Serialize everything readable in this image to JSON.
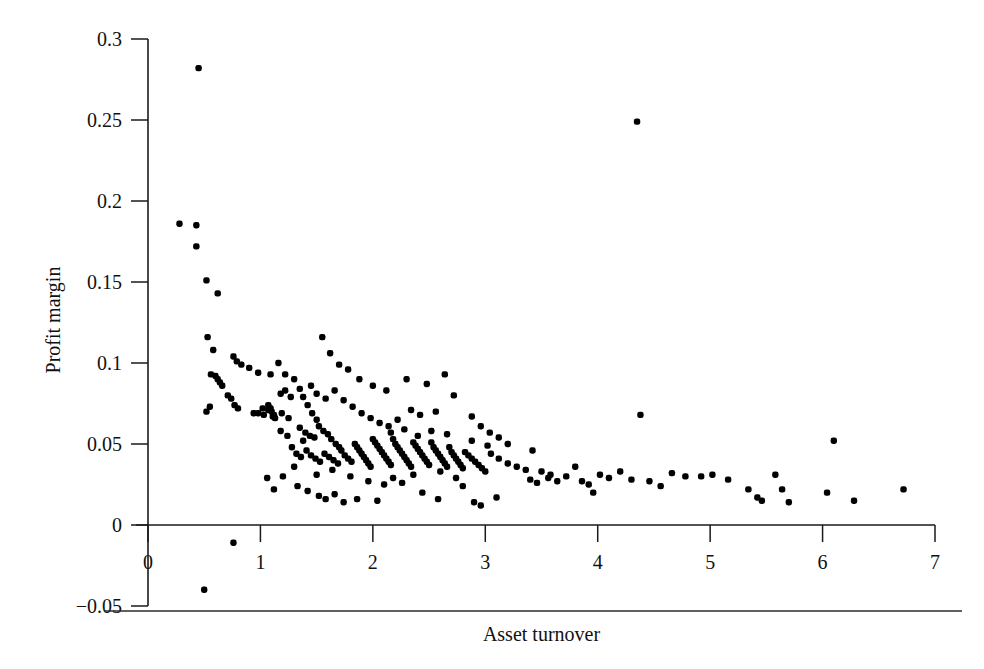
{
  "chart_data": {
    "type": "scatter",
    "title": "",
    "xlabel": "Asset turnover",
    "ylabel": "Profit margin",
    "xlim": [
      0,
      7
    ],
    "ylim": [
      -0.05,
      0.3
    ],
    "xticks": [
      0,
      1,
      2,
      3,
      4,
      5,
      6,
      7
    ],
    "xticklabels": [
      "0",
      "1",
      "2",
      "3",
      "4",
      "5",
      "6",
      "7"
    ],
    "yticks": [
      -0.05,
      0,
      0.05,
      0.1,
      0.15,
      0.2,
      0.25,
      0.3
    ],
    "yticklabels": [
      "−0.05",
      "0",
      "0.05",
      "0.1",
      "0.15",
      "0.2",
      "0.25",
      "0.3"
    ],
    "grid": false,
    "legend": false,
    "marker": "filled-square-dot",
    "marker_color": "#000000",
    "marker_size": 3.2,
    "n_points": 236,
    "series": [
      {
        "name": "Firms",
        "points": [
          [
            0.45,
            0.282
          ],
          [
            0.28,
            0.186
          ],
          [
            0.43,
            0.185
          ],
          [
            0.43,
            0.172
          ],
          [
            0.52,
            0.151
          ],
          [
            0.62,
            0.143
          ],
          [
            0.53,
            0.116
          ],
          [
            0.58,
            0.108
          ],
          [
            0.76,
            0.104
          ],
          [
            0.79,
            0.101
          ],
          [
            0.83,
            0.099
          ],
          [
            0.9,
            0.097
          ],
          [
            0.98,
            0.094
          ],
          [
            1.09,
            0.093
          ],
          [
            1.16,
            0.1
          ],
          [
            1.22,
            0.093
          ],
          [
            0.56,
            0.093
          ],
          [
            0.6,
            0.092
          ],
          [
            0.62,
            0.09
          ],
          [
            0.64,
            0.088
          ],
          [
            0.66,
            0.086
          ],
          [
            0.71,
            0.08
          ],
          [
            0.74,
            0.078
          ],
          [
            0.77,
            0.074
          ],
          [
            0.8,
            0.072
          ],
          [
            0.55,
            0.073
          ],
          [
            0.52,
            0.07
          ],
          [
            1.02,
            0.072
          ],
          [
            1.07,
            0.071
          ],
          [
            1.12,
            0.068
          ],
          [
            1.18,
            0.081
          ],
          [
            1.22,
            0.083
          ],
          [
            1.27,
            0.079
          ],
          [
            0.94,
            0.069
          ],
          [
            0.98,
            0.069
          ],
          [
            1.03,
            0.068
          ],
          [
            1.07,
            0.074
          ],
          [
            1.09,
            0.072
          ],
          [
            1.1,
            0.07
          ],
          [
            1.11,
            0.067
          ],
          [
            1.13,
            0.066
          ],
          [
            1.19,
            0.069
          ],
          [
            1.25,
            0.066
          ],
          [
            1.3,
            0.09
          ],
          [
            1.35,
            0.084
          ],
          [
            1.38,
            0.079
          ],
          [
            1.42,
            0.074
          ],
          [
            1.46,
            0.069
          ],
          [
            1.5,
            0.065
          ],
          [
            1.35,
            0.06
          ],
          [
            1.4,
            0.057
          ],
          [
            1.44,
            0.055
          ],
          [
            1.48,
            0.054
          ],
          [
            1.52,
            0.061
          ],
          [
            1.56,
            0.058
          ],
          [
            1.6,
            0.056
          ],
          [
            1.63,
            0.053
          ],
          [
            1.67,
            0.05
          ],
          [
            1.7,
            0.048
          ],
          [
            1.28,
            0.048
          ],
          [
            1.32,
            0.044
          ],
          [
            1.36,
            0.042
          ],
          [
            1.41,
            0.046
          ],
          [
            1.45,
            0.043
          ],
          [
            1.49,
            0.041
          ],
          [
            1.53,
            0.039
          ],
          [
            1.57,
            0.044
          ],
          [
            1.61,
            0.042
          ],
          [
            1.65,
            0.04
          ],
          [
            1.69,
            0.038
          ],
          [
            1.72,
            0.046
          ],
          [
            1.75,
            0.043
          ],
          [
            1.78,
            0.041
          ],
          [
            1.81,
            0.039
          ],
          [
            1.84,
            0.05
          ],
          [
            1.86,
            0.048
          ],
          [
            1.88,
            0.046
          ],
          [
            1.9,
            0.044
          ],
          [
            1.92,
            0.042
          ],
          [
            1.94,
            0.04
          ],
          [
            1.96,
            0.038
          ],
          [
            1.98,
            0.036
          ],
          [
            2.0,
            0.053
          ],
          [
            2.02,
            0.051
          ],
          [
            2.04,
            0.049
          ],
          [
            2.06,
            0.047
          ],
          [
            2.08,
            0.045
          ],
          [
            2.1,
            0.043
          ],
          [
            2.12,
            0.041
          ],
          [
            2.14,
            0.039
          ],
          [
            2.16,
            0.037
          ],
          [
            2.18,
            0.053
          ],
          [
            2.2,
            0.05
          ],
          [
            2.22,
            0.048
          ],
          [
            2.24,
            0.046
          ],
          [
            2.26,
            0.044
          ],
          [
            2.28,
            0.042
          ],
          [
            2.3,
            0.04
          ],
          [
            2.32,
            0.038
          ],
          [
            2.34,
            0.036
          ],
          [
            2.36,
            0.051
          ],
          [
            2.38,
            0.049
          ],
          [
            2.4,
            0.047
          ],
          [
            2.42,
            0.045
          ],
          [
            2.44,
            0.043
          ],
          [
            2.46,
            0.041
          ],
          [
            2.48,
            0.039
          ],
          [
            2.5,
            0.037
          ],
          [
            2.52,
            0.051
          ],
          [
            2.54,
            0.048
          ],
          [
            2.56,
            0.046
          ],
          [
            2.58,
            0.044
          ],
          [
            2.6,
            0.042
          ],
          [
            2.62,
            0.04
          ],
          [
            2.64,
            0.038
          ],
          [
            2.66,
            0.036
          ],
          [
            2.68,
            0.048
          ],
          [
            2.7,
            0.045
          ],
          [
            2.72,
            0.043
          ],
          [
            2.74,
            0.041
          ],
          [
            2.76,
            0.039
          ],
          [
            2.78,
            0.037
          ],
          [
            2.8,
            0.035
          ],
          [
            2.82,
            0.045
          ],
          [
            2.85,
            0.043
          ],
          [
            2.88,
            0.041
          ],
          [
            2.91,
            0.039
          ],
          [
            2.94,
            0.037
          ],
          [
            2.97,
            0.035
          ],
          [
            3.0,
            0.033
          ],
          [
            1.55,
            0.116
          ],
          [
            1.62,
            0.106
          ],
          [
            1.7,
            0.099
          ],
          [
            1.78,
            0.096
          ],
          [
            1.88,
            0.09
          ],
          [
            2.0,
            0.086
          ],
          [
            2.12,
            0.083
          ],
          [
            2.3,
            0.09
          ],
          [
            2.48,
            0.087
          ],
          [
            2.64,
            0.093
          ],
          [
            1.45,
            0.086
          ],
          [
            1.5,
            0.081
          ],
          [
            1.58,
            0.078
          ],
          [
            1.66,
            0.083
          ],
          [
            1.74,
            0.077
          ],
          [
            1.82,
            0.073
          ],
          [
            1.9,
            0.069
          ],
          [
            1.98,
            0.066
          ],
          [
            2.06,
            0.063
          ],
          [
            2.14,
            0.061
          ],
          [
            2.22,
            0.065
          ],
          [
            2.34,
            0.071
          ],
          [
            2.42,
            0.068
          ],
          [
            2.56,
            0.07
          ],
          [
            2.72,
            0.08
          ],
          [
            2.88,
            0.067
          ],
          [
            2.96,
            0.061
          ],
          [
            3.04,
            0.057
          ],
          [
            3.12,
            0.054
          ],
          [
            3.2,
            0.05
          ],
          [
            3.05,
            0.044
          ],
          [
            3.12,
            0.041
          ],
          [
            3.2,
            0.038
          ],
          [
            3.28,
            0.036
          ],
          [
            3.36,
            0.034
          ],
          [
            3.42,
            0.046
          ],
          [
            3.5,
            0.033
          ],
          [
            3.58,
            0.031
          ],
          [
            3.4,
            0.028
          ],
          [
            3.46,
            0.026
          ],
          [
            3.56,
            0.029
          ],
          [
            3.64,
            0.027
          ],
          [
            3.72,
            0.03
          ],
          [
            3.8,
            0.036
          ],
          [
            3.86,
            0.027
          ],
          [
            3.92,
            0.025
          ],
          [
            3.96,
            0.02
          ],
          [
            4.02,
            0.031
          ],
          [
            4.1,
            0.029
          ],
          [
            4.2,
            0.033
          ],
          [
            4.3,
            0.028
          ],
          [
            4.38,
            0.068
          ],
          [
            4.35,
            0.249
          ],
          [
            4.46,
            0.027
          ],
          [
            4.56,
            0.024
          ],
          [
            4.66,
            0.032
          ],
          [
            4.78,
            0.03
          ],
          [
            4.92,
            0.03
          ],
          [
            5.02,
            0.031
          ],
          [
            5.16,
            0.028
          ],
          [
            5.34,
            0.022
          ],
          [
            5.42,
            0.017
          ],
          [
            5.46,
            0.015
          ],
          [
            5.58,
            0.031
          ],
          [
            5.64,
            0.022
          ],
          [
            5.7,
            0.014
          ],
          [
            6.1,
            0.052
          ],
          [
            6.04,
            0.02
          ],
          [
            6.28,
            0.015
          ],
          [
            6.72,
            0.022
          ],
          [
            0.76,
            -0.011
          ],
          [
            0.5,
            -0.04
          ],
          [
            1.06,
            0.029
          ],
          [
            1.12,
            0.022
          ],
          [
            1.2,
            0.03
          ],
          [
            1.33,
            0.024
          ],
          [
            1.42,
            0.021
          ],
          [
            1.52,
            0.018
          ],
          [
            1.58,
            0.016
          ],
          [
            1.66,
            0.019
          ],
          [
            1.74,
            0.014
          ],
          [
            1.86,
            0.016
          ],
          [
            2.04,
            0.015
          ],
          [
            2.26,
            0.026
          ],
          [
            2.44,
            0.02
          ],
          [
            2.58,
            0.016
          ],
          [
            2.8,
            0.024
          ],
          [
            2.9,
            0.014
          ],
          [
            2.96,
            0.012
          ],
          [
            3.1,
            0.017
          ],
          [
            2.18,
            0.029
          ],
          [
            2.36,
            0.031
          ],
          [
            2.6,
            0.033
          ],
          [
            2.74,
            0.029
          ],
          [
            1.96,
            0.027
          ],
          [
            2.1,
            0.025
          ],
          [
            1.8,
            0.03
          ],
          [
            1.64,
            0.034
          ],
          [
            1.5,
            0.031
          ],
          [
            1.3,
            0.036
          ],
          [
            1.24,
            0.055
          ],
          [
            1.18,
            0.058
          ],
          [
            1.38,
            0.052
          ],
          [
            2.88,
            0.052
          ],
          [
            3.02,
            0.049
          ],
          [
            2.66,
            0.056
          ],
          [
            2.52,
            0.058
          ],
          [
            2.4,
            0.055
          ],
          [
            2.28,
            0.059
          ],
          [
            2.16,
            0.057
          ]
        ]
      }
    ]
  }
}
